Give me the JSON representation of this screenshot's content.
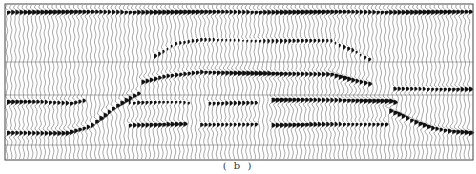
{
  "figure": {
    "caption": "( b )",
    "type": "seismic wiggle-trace section",
    "frame": {
      "x0": 5,
      "y0": 4,
      "x1": 473,
      "y1": 160
    },
    "trace_spacing_px": 4.2,
    "gridlines_y": [
      62,
      95,
      145
    ],
    "colors": {
      "ink": "#111111",
      "trace": "#555555",
      "grid": "#777777",
      "background": "#ffffff"
    },
    "reflectors": [
      {
        "name": "top-reflector",
        "points": [
          [
            5,
            12
          ],
          [
            473,
            12
          ]
        ],
        "amp": 1.0,
        "thick": 7
      },
      {
        "name": "anticline-upper",
        "points": [
          [
            150,
            58
          ],
          [
            175,
            44
          ],
          [
            200,
            40
          ],
          [
            330,
            41
          ],
          [
            355,
            52
          ],
          [
            370,
            60
          ]
        ],
        "amp": 0.55,
        "thick": 6
      },
      {
        "name": "anticline-main",
        "points": [
          [
            140,
            82
          ],
          [
            165,
            76
          ],
          [
            200,
            72
          ],
          [
            280,
            74
          ],
          [
            330,
            74
          ],
          [
            350,
            80
          ],
          [
            370,
            84
          ]
        ],
        "amp": 1.0,
        "thick": 8
      },
      {
        "name": "left-flank-upper",
        "points": [
          [
            5,
            102
          ],
          [
            40,
            102
          ],
          [
            70,
            103
          ],
          [
            85,
            100
          ]
        ],
        "amp": 0.9,
        "thick": 7
      },
      {
        "name": "left-ramp",
        "points": [
          [
            5,
            133
          ],
          [
            65,
            133
          ],
          [
            90,
            126
          ],
          [
            110,
            110
          ],
          [
            125,
            100
          ],
          [
            140,
            92
          ]
        ],
        "amp": 1.0,
        "thick": 8
      },
      {
        "name": "mid-segment-1",
        "points": [
          [
            125,
            103
          ],
          [
            180,
            102
          ],
          [
            190,
            103
          ]
        ],
        "amp": 0.7,
        "thick": 6
      },
      {
        "name": "mid-segment-2",
        "points": [
          [
            205,
            103
          ],
          [
            255,
            103
          ]
        ],
        "amp": 0.6,
        "thick": 6
      },
      {
        "name": "right-flat-upper",
        "points": [
          [
            270,
            100
          ],
          [
            340,
            100
          ],
          [
            388,
            101
          ],
          [
            395,
            103
          ]
        ],
        "amp": 1.0,
        "thick": 8
      },
      {
        "name": "right-flank-upper",
        "points": [
          [
            392,
            89
          ],
          [
            473,
            89
          ]
        ],
        "amp": 0.85,
        "thick": 7
      },
      {
        "name": "lower-seg-1",
        "points": [
          [
            125,
            125
          ],
          [
            185,
            124
          ]
        ],
        "amp": 0.85,
        "thick": 7
      },
      {
        "name": "lower-seg-2",
        "points": [
          [
            200,
            125
          ],
          [
            258,
            124
          ]
        ],
        "amp": 0.85,
        "thick": 7
      },
      {
        "name": "lower-seg-3",
        "points": [
          [
            270,
            125
          ],
          [
            388,
            124
          ]
        ],
        "amp": 0.85,
        "thick": 7
      },
      {
        "name": "right-ramp",
        "points": [
          [
            388,
            110
          ],
          [
            410,
            120
          ],
          [
            430,
            128
          ],
          [
            450,
            131
          ],
          [
            473,
            133
          ]
        ],
        "amp": 1.0,
        "thick": 8
      }
    ]
  }
}
